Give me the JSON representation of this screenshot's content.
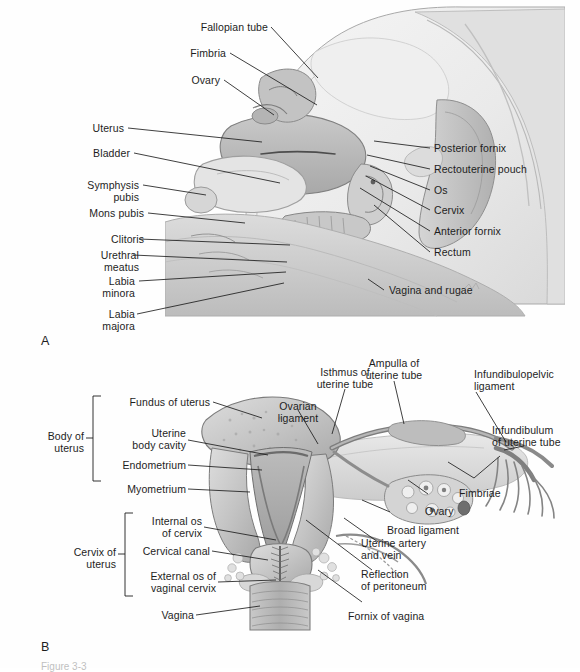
{
  "figure": {
    "panel_a_letter": "A",
    "panel_b_letter": "B",
    "caption": "Figure 3-3"
  },
  "panel_a": {
    "title": "Midsagittal view of female pelvic organs",
    "labels_left": [
      {
        "text": "Fallopian tube"
      },
      {
        "text": "Fimbria"
      },
      {
        "text": "Ovary"
      },
      {
        "text": "Uterus"
      },
      {
        "text": "Bladder"
      },
      {
        "text": "Symphysis\npubis"
      },
      {
        "text": "Mons pubis"
      },
      {
        "text": "Clitoris"
      },
      {
        "text": "Urethral\nmeatus"
      },
      {
        "text": "Labia\nminora"
      },
      {
        "text": "Labia\nmajora"
      }
    ],
    "labels_right": [
      {
        "text": "Posterior fornix"
      },
      {
        "text": "Rectouterine pouch"
      },
      {
        "text": "Os"
      },
      {
        "text": "Cervix"
      },
      {
        "text": "Anterior fornix"
      },
      {
        "text": "Rectum"
      },
      {
        "text": "Vagina and rugae"
      }
    ]
  },
  "panel_b": {
    "title": "Coronal section of uterus and adnexa",
    "brackets": [
      {
        "text": "Body of\nuterus"
      },
      {
        "text": "Cervix of\nuterus"
      }
    ],
    "labels_left": [
      {
        "text": "Fundus of uterus"
      },
      {
        "text": "Uterine\nbody cavity"
      },
      {
        "text": "Endometrium"
      },
      {
        "text": "Myometrium"
      },
      {
        "text": "Internal os\nof cervix"
      },
      {
        "text": "Cervical canal"
      },
      {
        "text": "External os of\nvaginal cervix"
      },
      {
        "text": "Vagina"
      }
    ],
    "labels_top": [
      {
        "text": "Ovarian\nligament"
      },
      {
        "text": "Isthmus of\nuterine tube"
      },
      {
        "text": "Ampulla of\nuterine tube"
      },
      {
        "text": "Infundibulopelvic\nligament"
      },
      {
        "text": "Infundibulum\nof uterine tube"
      }
    ],
    "labels_right": [
      {
        "text": "Fimbriae"
      },
      {
        "text": "Ovary"
      },
      {
        "text": "Broad ligament"
      },
      {
        "text": "Uterine artery\nand vein"
      },
      {
        "text": "Reflection\nof peritoneum"
      },
      {
        "text": "Fornix of vagina"
      }
    ]
  },
  "colors": {
    "ink": "#1d1d1d",
    "tissue_light": "#e9e9e9",
    "tissue_mid": "#c6c6c6",
    "tissue_dark": "#9a9a9a",
    "tissue_darker": "#777777",
    "outline": "#6f6f6f",
    "background": "#ffffff"
  }
}
